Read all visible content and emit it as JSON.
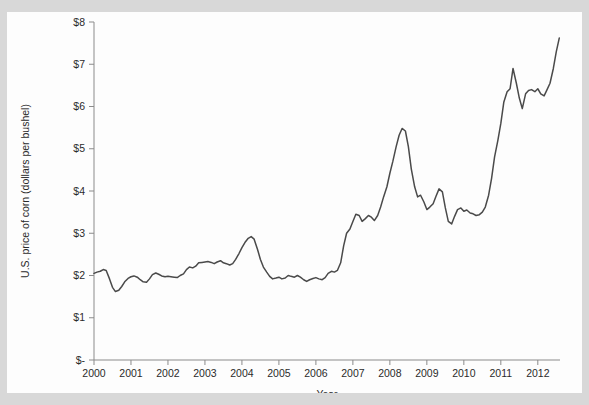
{
  "chart_data": {
    "type": "line",
    "title": "",
    "xlabel": "Year",
    "ylabel": "U.S. price of corn (dollars per bushel)",
    "xlim": [
      2000.0,
      2012.6
    ],
    "ylim": [
      0,
      8
    ],
    "grid": false,
    "legend": null,
    "y_tick_labels": [
      "$8",
      "$7",
      "$6",
      "$5",
      "$4",
      "$3",
      "$2",
      "$1",
      "$-"
    ],
    "y_tick_values": [
      8,
      7,
      6,
      5,
      4,
      3,
      2,
      1,
      0
    ],
    "x_tick_labels": [
      "2000",
      "2001",
      "2002",
      "2003",
      "2004",
      "2005",
      "2006",
      "2007",
      "2008",
      "2009",
      "2010",
      "2011",
      "2012"
    ],
    "x_tick_values": [
      2000,
      2001,
      2002,
      2003,
      2004,
      2005,
      2006,
      2007,
      2008,
      2009,
      2010,
      2011,
      2012
    ],
    "series": [
      {
        "name": "U.S. price of corn",
        "units": "dollars per bushel",
        "x": [
          2000.0,
          2000.08,
          2000.17,
          2000.25,
          2000.33,
          2000.42,
          2000.5,
          2000.58,
          2000.67,
          2000.75,
          2000.83,
          2000.92,
          2001.0,
          2001.08,
          2001.17,
          2001.25,
          2001.33,
          2001.42,
          2001.5,
          2001.58,
          2001.67,
          2001.75,
          2001.83,
          2001.92,
          2002.0,
          2002.08,
          2002.17,
          2002.25,
          2002.33,
          2002.42,
          2002.5,
          2002.58,
          2002.67,
          2002.75,
          2002.83,
          2002.92,
          2003.0,
          2003.08,
          2003.17,
          2003.25,
          2003.33,
          2003.42,
          2003.5,
          2003.58,
          2003.67,
          2003.75,
          2003.83,
          2003.92,
          2004.0,
          2004.08,
          2004.17,
          2004.25,
          2004.33,
          2004.42,
          2004.5,
          2004.58,
          2004.67,
          2004.75,
          2004.83,
          2004.92,
          2005.0,
          2005.08,
          2005.17,
          2005.25,
          2005.33,
          2005.42,
          2005.5,
          2005.58,
          2005.67,
          2005.75,
          2005.83,
          2005.92,
          2006.0,
          2006.08,
          2006.17,
          2006.25,
          2006.33,
          2006.42,
          2006.5,
          2006.58,
          2006.67,
          2006.75,
          2006.83,
          2006.92,
          2007.0,
          2007.08,
          2007.17,
          2007.25,
          2007.33,
          2007.42,
          2007.5,
          2007.58,
          2007.67,
          2007.75,
          2007.83,
          2007.92,
          2008.0,
          2008.08,
          2008.17,
          2008.25,
          2008.33,
          2008.42,
          2008.5,
          2008.58,
          2008.67,
          2008.75,
          2008.83,
          2008.92,
          2009.0,
          2009.08,
          2009.17,
          2009.25,
          2009.33,
          2009.42,
          2009.5,
          2009.58,
          2009.67,
          2009.75,
          2009.83,
          2009.92,
          2010.0,
          2010.08,
          2010.17,
          2010.25,
          2010.33,
          2010.42,
          2010.5,
          2010.58,
          2010.67,
          2010.75,
          2010.83,
          2010.92,
          2011.0,
          2011.08,
          2011.17,
          2011.25,
          2011.33,
          2011.42,
          2011.5,
          2011.58,
          2011.67,
          2011.75,
          2011.83,
          2011.92,
          2012.0,
          2012.08,
          2012.17,
          2012.25,
          2012.33,
          2012.42,
          2012.5,
          2012.58
        ],
        "values": [
          2.05,
          2.08,
          2.1,
          2.14,
          2.12,
          1.92,
          1.72,
          1.62,
          1.65,
          1.74,
          1.85,
          1.93,
          1.97,
          1.99,
          1.96,
          1.9,
          1.85,
          1.84,
          1.92,
          2.02,
          2.06,
          2.03,
          1.99,
          1.97,
          1.98,
          1.97,
          1.96,
          1.95,
          2.0,
          2.04,
          2.14,
          2.2,
          2.18,
          2.22,
          2.3,
          2.31,
          2.32,
          2.33,
          2.31,
          2.28,
          2.32,
          2.35,
          2.3,
          2.28,
          2.25,
          2.28,
          2.38,
          2.52,
          2.66,
          2.78,
          2.88,
          2.92,
          2.86,
          2.62,
          2.38,
          2.2,
          2.08,
          1.98,
          1.92,
          1.94,
          1.96,
          1.92,
          1.94,
          2.0,
          1.98,
          1.96,
          2.0,
          1.96,
          1.9,
          1.86,
          1.9,
          1.93,
          1.95,
          1.92,
          1.9,
          1.95,
          2.05,
          2.1,
          2.08,
          2.12,
          2.3,
          2.7,
          3.0,
          3.1,
          3.28,
          3.45,
          3.42,
          3.28,
          3.34,
          3.42,
          3.38,
          3.3,
          3.42,
          3.62,
          3.86,
          4.1,
          4.42,
          4.7,
          5.05,
          5.32,
          5.48,
          5.42,
          5.05,
          4.52,
          4.1,
          3.86,
          3.9,
          3.74,
          3.56,
          3.62,
          3.7,
          3.88,
          4.05,
          3.98,
          3.6,
          3.28,
          3.22,
          3.4,
          3.56,
          3.6,
          3.52,
          3.55,
          3.48,
          3.46,
          3.42,
          3.44,
          3.5,
          3.62,
          3.9,
          4.3,
          4.8,
          5.2,
          5.6,
          6.1,
          6.35,
          6.42,
          6.9,
          6.55,
          6.2,
          5.95,
          6.3,
          6.38,
          6.4,
          6.35,
          6.42,
          6.3,
          6.25,
          6.4,
          6.55,
          6.9,
          7.3,
          7.62
        ]
      }
    ]
  },
  "plot_geometry": {
    "x_left_px": 87,
    "x_right_px": 553,
    "y_top_px": 10,
    "y_bottom_px": 348,
    "x_min": 2000.0,
    "x_max": 2012.6,
    "y_min": 0,
    "y_max": 8
  }
}
